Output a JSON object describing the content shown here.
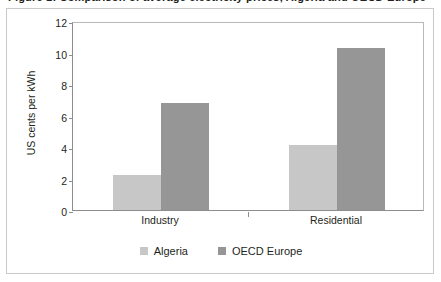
{
  "caption": {
    "text": "Figure 1: Comparison of average electricity prices, Algeria and OECD Europe"
  },
  "colors": {
    "algeria": "#c7c7c7",
    "oecd_europe": "#969696",
    "axis": "#8d8d8d",
    "text": "#231f20",
    "frame": "#c9c9c9",
    "background": "#ffffff"
  },
  "chart_data": {
    "type": "bar",
    "title": "",
    "subtitle": "",
    "xlabel": "",
    "ylabel": "US cents per kWh",
    "categories": [
      "Industry",
      "Residential"
    ],
    "series": [
      {
        "name": "Algeria",
        "color": "#c7c7c7",
        "values": [
          2.2,
          4.1
        ]
      },
      {
        "name": "OECD Europe",
        "color": "#969696",
        "values": [
          6.8,
          10.3
        ]
      }
    ],
    "ylim": [
      0,
      12
    ],
    "yticks": [
      0,
      2,
      4,
      6,
      8,
      10,
      12
    ],
    "ytick_labels": [
      "0",
      "2",
      "4",
      "6",
      "8",
      "10",
      "12"
    ],
    "grid": false,
    "legend_position": "bottom",
    "annotations": []
  },
  "legend": {
    "entries": [
      {
        "label": "Algeria"
      },
      {
        "label": "OECD Europe"
      }
    ]
  }
}
